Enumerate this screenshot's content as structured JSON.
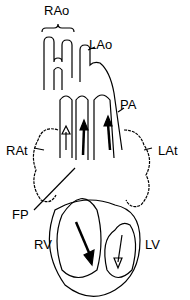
{
  "diagram": {
    "type": "heart anatomy schematic",
    "labels": {
      "rao": "RAo",
      "lao": "LAo",
      "pa": "PA",
      "rat": "RAt",
      "lat": "LAt",
      "fp": "FP",
      "rv": "RV",
      "lv": "LV"
    }
  }
}
